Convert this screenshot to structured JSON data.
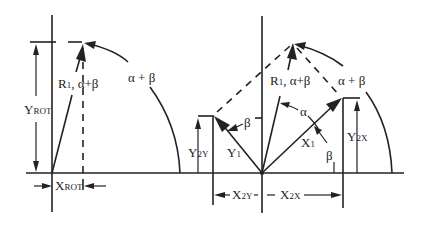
{
  "diagram": {
    "left": {
      "labels": {
        "y_rot_main": "Y",
        "y_rot_sub": "ROT",
        "x_rot_main": "X",
        "x_rot_sub": "ROT",
        "vector": "R",
        "vector_sub": "1",
        "vector_angle": ", α+β",
        "arc_angle": "α + β"
      }
    },
    "right": {
      "labels": {
        "vector": "R",
        "vector_sub": "1",
        "vector_angle": ", α+β",
        "arc_angle": "α + β",
        "alpha": "α",
        "beta_upper": "β",
        "beta_lower": "β",
        "x1_main": "X",
        "x1_sub": "1",
        "y1_main": "Y",
        "y1_sub": "1",
        "y2x_main": "Y",
        "y2x_sub": "2X",
        "y2y_main": "Y",
        "y2y_sub": "2Y",
        "x2y_main": "X",
        "x2y_sub": "2Y",
        "x2x_main": "X",
        "x2x_sub": "2X"
      }
    },
    "colors": {
      "ink": "#222222",
      "background": "#ffffff"
    }
  }
}
